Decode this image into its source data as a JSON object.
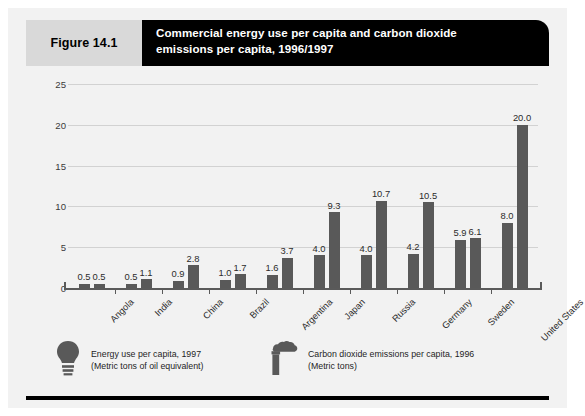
{
  "figure": {
    "number_label": "Figure 14.1",
    "title_line1": "Commercial energy use per capita and carbon dioxide",
    "title_line2": "emissions per capita, 1996/1997"
  },
  "legend": [
    {
      "icon": "lightbulb-icon",
      "line1": "Energy use per capita, 1997",
      "line2": "(Metric tons of oil equivalent)"
    },
    {
      "icon": "smokestack-icon",
      "line1": "Carbon dioxide emissions per capita, 1996",
      "line2": "(Metric tons)"
    }
  ],
  "colors": {
    "bar": "#595959",
    "banner": "#000000",
    "fig_num_box": "#d9d9d9",
    "panel": "#f2f2f2",
    "gridline": "#d2d2d2"
  },
  "chart_data": {
    "type": "bar",
    "title": "Commercial energy use per capita and carbon dioxide emissions per capita, 1996/1997",
    "xlabel": "",
    "ylabel": "",
    "ylim": [
      0,
      25
    ],
    "yticks": [
      0,
      5,
      10,
      15,
      20,
      25
    ],
    "ytick_labels": [
      "0",
      "5",
      "10",
      "15",
      "20",
      "25"
    ],
    "grid": true,
    "legend_position": "bottom",
    "categories": [
      "Angola",
      "India",
      "China",
      "Brazil",
      "Argentina",
      "Japan",
      "Russia",
      "Germany",
      "Sweden",
      "United States"
    ],
    "series": [
      {
        "name": "Energy use per capita, 1997 (Metric tons of oil equivalent)",
        "values": [
          0.5,
          0.5,
          0.9,
          1.0,
          1.6,
          4.0,
          4.0,
          4.2,
          5.9,
          8.0
        ],
        "labels": [
          "0.5",
          "0.5",
          "0.9",
          "1.0",
          "1.6",
          "4.0",
          "4.0",
          "4.2",
          "5.9",
          "8.0"
        ]
      },
      {
        "name": "Carbon dioxide emissions per capita, 1996 (Metric tons)",
        "values": [
          0.5,
          1.1,
          2.8,
          1.7,
          3.7,
          9.3,
          10.7,
          10.5,
          6.1,
          20.0
        ],
        "labels": [
          "0.5",
          "1.1",
          "2.8",
          "1.7",
          "3.7",
          "9.3",
          "10.7",
          "10.5",
          "6.1",
          "20.0"
        ]
      }
    ]
  }
}
